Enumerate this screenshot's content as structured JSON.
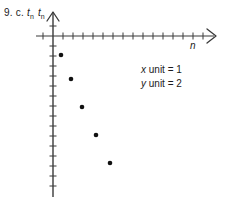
{
  "figure": {
    "label_number": "9.",
    "label_part": "c.",
    "y_axis_symbol": "t",
    "y_axis_subscript": "n",
    "x_axis_symbol": "n",
    "ink_color": "#3a3a3a",
    "point_color": "#111111",
    "background": "#ffffff"
  },
  "annotations": {
    "x_unit_var": "x",
    "x_unit_text": " unit = 1",
    "y_unit_var": "y",
    "y_unit_text": " unit = 2"
  },
  "chart_data": {
    "type": "scatter",
    "title": "",
    "xlabel": "n",
    "ylabel": "t_n",
    "x_unit": 1,
    "y_unit": 2,
    "grid": false,
    "legend": false,
    "x_axis": {
      "position_px": 36,
      "origin_px": 53,
      "end_px": 214,
      "tick_spacing_px": 10,
      "tick_count_positive": 15,
      "tick_count_negative": 1,
      "arrow": true
    },
    "y_axis": {
      "position_px": 53,
      "top_px": 12,
      "bottom_px": 197,
      "tick_spacing_px": 10,
      "arrow": true
    },
    "x": [
      1,
      2,
      3,
      4,
      5
    ],
    "y": [
      -4,
      -9,
      -15,
      -20,
      -26
    ],
    "points_px": [
      {
        "x": 61,
        "y": 55
      },
      {
        "x": 71,
        "y": 79
      },
      {
        "x": 82,
        "y": 107
      },
      {
        "x": 96,
        "y": 135
      },
      {
        "x": 110,
        "y": 163
      }
    ],
    "series": [
      {
        "name": "t_n",
        "values": [
          -4,
          -9,
          -15,
          -20,
          -26
        ]
      }
    ],
    "xlim": [
      -1.7,
      16
    ],
    "ylim": [
      -37,
      5
    ]
  }
}
